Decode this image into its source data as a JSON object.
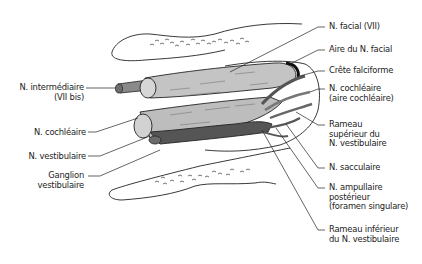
{
  "figure": {
    "colors": {
      "outline": "#222222",
      "nerve_light": "#bdbdbd",
      "nerve_mid": "#9a9a9a",
      "nerve_dark": "#555555",
      "background": "#ffffff"
    }
  },
  "labels_left": [
    {
      "id": "n-intermediaire",
      "lines": [
        "N. intermédiaire",
        "(VII bis)"
      ]
    },
    {
      "id": "n-cochleaire",
      "lines": [
        "N. cochléaire"
      ]
    },
    {
      "id": "n-vestibulaire",
      "lines": [
        "N. vestibulaire"
      ]
    },
    {
      "id": "ganglion-vestibulaire",
      "lines": [
        "Ganglion",
        "vestibulaire"
      ]
    }
  ],
  "labels_right": [
    {
      "id": "n-facial",
      "lines": [
        "N. facial (VII)"
      ]
    },
    {
      "id": "aire-n-facial",
      "lines": [
        "Aire du N. facial"
      ]
    },
    {
      "id": "crete-falciforme",
      "lines": [
        "Crête falciforme"
      ]
    },
    {
      "id": "n-cochleaire-aire",
      "lines": [
        "N. cochléaire",
        "(aire cochléaire)"
      ]
    },
    {
      "id": "rameau-superieur",
      "lines": [
        "Rameau",
        "supérieur du",
        "N. vestibulaire"
      ]
    },
    {
      "id": "n-sacculaire",
      "lines": [
        "N. sacculaire"
      ]
    },
    {
      "id": "n-ampullaire-posterieur",
      "lines": [
        "N. ampullaire",
        "postérieur",
        "(foramen singulare)"
      ]
    },
    {
      "id": "rameau-inferieur",
      "lines": [
        "Rameau inférieur",
        "du N. vestibulaire"
      ]
    }
  ]
}
